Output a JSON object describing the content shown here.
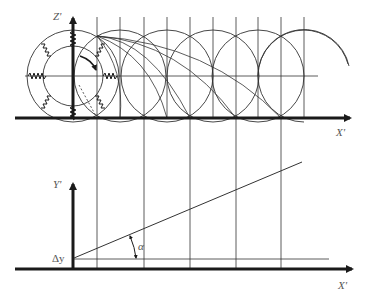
{
  "diagram": {
    "colors": {
      "ink": "#1a1a1a",
      "thin": "#333333",
      "background": "#ffffff"
    },
    "top_panel": {
      "z_axis_label": "Z'",
      "x_axis_label": "X'",
      "ring": {
        "cx": 73,
        "cy": 76,
        "outer_r": 46,
        "inner_r": 30,
        "springs": 8
      },
      "circles": {
        "centers_x": [
          120,
          167,
          213,
          258
        ],
        "partial_center_x": 304,
        "cy": 76,
        "r": 46
      },
      "vertical_lines_x": [
        97,
        120,
        144,
        167,
        190,
        213,
        236,
        258,
        281,
        304
      ],
      "axis_y": 118,
      "center_line": {
        "y": 76,
        "x1": 25,
        "x2": 318
      }
    },
    "bottom_panel": {
      "y_axis_label": "Y'",
      "x_axis_label": "X'",
      "offset_label": "Δy",
      "angle_label": "α",
      "axis_y": 269,
      "offset_line_y": 259,
      "slope_line": {
        "x1": 74,
        "y1": 258,
        "x2": 302,
        "y2": 162
      },
      "vertical_lines_x": [
        97,
        144,
        190,
        236,
        281
      ]
    }
  }
}
